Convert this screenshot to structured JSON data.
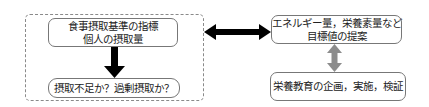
{
  "diagram": {
    "left_group": {
      "top_box": {
        "line1": "食事摂取基準の指標",
        "line2": "個人の摂取量"
      },
      "bottom_box": {
        "text": "摂取不足か？過剰摂取か？"
      }
    },
    "right_group": {
      "top_box": {
        "line1": "エネルギー量，栄養素量など",
        "line2": "目標値の提案"
      },
      "bottom_box": {
        "text": "栄養教育の企画，実施，検証"
      }
    },
    "connectors": {
      "left_down_arrow": {
        "direction": "down",
        "color": "#000000"
      },
      "center_double_arrow": {
        "direction": "bidirectional-horizontal",
        "color": "#000000"
      },
      "right_double_arrow": {
        "direction": "bidirectional-vertical",
        "color": "#8c8c8c"
      }
    },
    "colors": {
      "frame": "#8a8a8a",
      "box_border": "#777777",
      "text": "#222222"
    }
  }
}
